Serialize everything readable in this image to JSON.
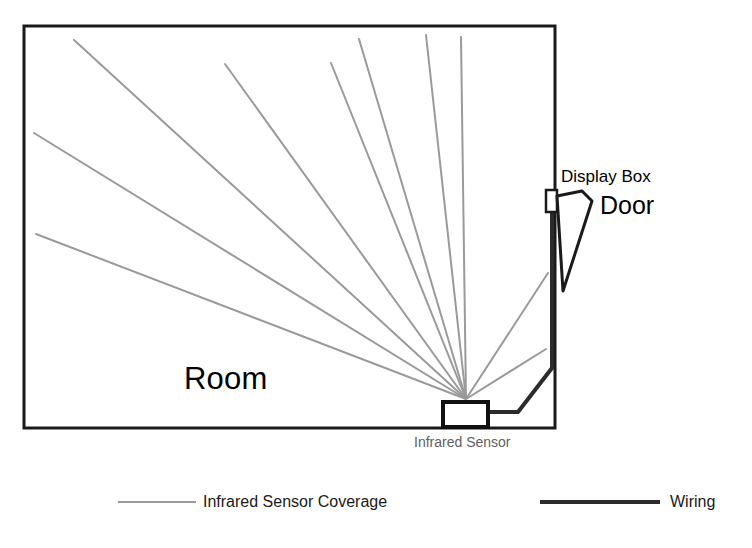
{
  "diagram": {
    "labels": {
      "room": "Room",
      "display_box": "Display Box",
      "door": "Door",
      "infrared_sensor": "Infrared Sensor"
    },
    "legend": {
      "items": [
        {
          "label": "Infrared Sensor Coverage",
          "color": "#9a9a9a",
          "stroke_width": 2,
          "swatch": "line"
        },
        {
          "label": "Wiring",
          "color": "#2b2b2b",
          "stroke_width": 4,
          "swatch": "line"
        }
      ]
    },
    "colors": {
      "wall": "#1a1a1a",
      "coverage_ray": "#9a9a9a",
      "wiring": "#2b2b2b",
      "sensor_outline": "#111111",
      "door_outline": "#1a1a1a",
      "background": "#ffffff",
      "sensor_label_text": "#5f5f5f"
    },
    "geometry": {
      "room": {
        "x": 24,
        "y": 26,
        "width": 531,
        "height": 402
      },
      "sensor_box": {
        "x": 443,
        "y": 402,
        "width": 45,
        "height": 25
      },
      "sensor_origin": {
        "x": 466,
        "y": 399
      },
      "display_box": {
        "x": 546,
        "y": 190,
        "width": 11,
        "height": 22
      },
      "coverage_ray_endpoints": [
        {
          "x": 74,
          "y": 40
        },
        {
          "x": 34,
          "y": 133
        },
        {
          "x": 36,
          "y": 234
        },
        {
          "x": 225,
          "y": 64
        },
        {
          "x": 331,
          "y": 63
        },
        {
          "x": 359,
          "y": 39
        },
        {
          "x": 426,
          "y": 35
        },
        {
          "x": 461,
          "y": 37
        },
        {
          "x": 548,
          "y": 273
        },
        {
          "x": 546,
          "y": 349
        }
      ],
      "wiring_path": [
        {
          "x": 488,
          "y": 412
        },
        {
          "x": 518,
          "y": 412
        },
        {
          "x": 552,
          "y": 368
        },
        {
          "x": 552,
          "y": 212
        }
      ],
      "door_polygon": [
        {
          "x": 557,
          "y": 196
        },
        {
          "x": 582,
          "y": 191
        },
        {
          "x": 592,
          "y": 201
        },
        {
          "x": 563,
          "y": 291
        }
      ],
      "legend_swatches": [
        {
          "x1": 118,
          "y1": 502,
          "x2": 196,
          "y2": 502
        },
        {
          "x1": 540,
          "y1": 502,
          "x2": 660,
          "y2": 502
        }
      ]
    }
  }
}
